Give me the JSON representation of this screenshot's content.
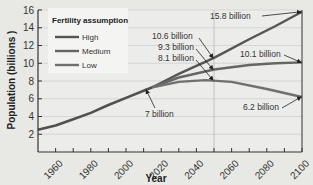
{
  "chart_data": {
    "type": "line",
    "title": "",
    "xlabel": "Year",
    "ylabel": "Population (billions )",
    "xlim": [
      1950,
      2100
    ],
    "ylim": [
      0,
      16
    ],
    "x_ticks": [
      1960,
      1980,
      2000,
      2020,
      2040,
      2060,
      2080,
      2100
    ],
    "y_ticks": [
      2,
      4,
      6,
      8,
      10,
      12,
      14,
      16
    ],
    "grid": "horizontal",
    "legend": {
      "title": "Fertility assumption",
      "placement": "top-left",
      "entries": [
        "High",
        "Medium",
        "Low"
      ]
    },
    "historical": {
      "x": [
        1950,
        1960,
        1970,
        1980,
        1990,
        2000,
        2010,
        2015
      ],
      "y": [
        2.5,
        3.0,
        3.7,
        4.4,
        5.3,
        6.1,
        6.9,
        7.3
      ]
    },
    "series": [
      {
        "name": "High",
        "x": [
          2015,
          2030,
          2050,
          2070,
          2085,
          2100
        ],
        "y": [
          7.3,
          8.8,
          10.6,
          12.7,
          14.2,
          15.8
        ],
        "color": "#555555"
      },
      {
        "name": "Medium",
        "x": [
          2015,
          2030,
          2050,
          2070,
          2085,
          2100
        ],
        "y": [
          7.3,
          8.4,
          9.3,
          9.8,
          10.0,
          10.1
        ],
        "color": "#666666"
      },
      {
        "name": "Low",
        "x": [
          2015,
          2030,
          2045,
          2060,
          2080,
          2100
        ],
        "y": [
          7.3,
          7.9,
          8.1,
          7.9,
          7.1,
          6.2
        ],
        "color": "#6f6f6f"
      }
    ],
    "reference_line_x": 2050,
    "annotations": [
      {
        "text": "15.8 billion",
        "x": 2100,
        "y": 15.8
      },
      {
        "text": "10.6 billion",
        "x": 2050,
        "y": 10.6
      },
      {
        "text": "9.3 billion",
        "x": 2050,
        "y": 9.3
      },
      {
        "text": "8.1 billion",
        "x": 2050,
        "y": 8.1
      },
      {
        "text": "10.1 billion",
        "x": 2100,
        "y": 10.1
      },
      {
        "text": "7 billion",
        "x": 2012,
        "y": 7.0
      },
      {
        "text": "6.2 billion",
        "x": 2100,
        "y": 6.2
      }
    ]
  }
}
